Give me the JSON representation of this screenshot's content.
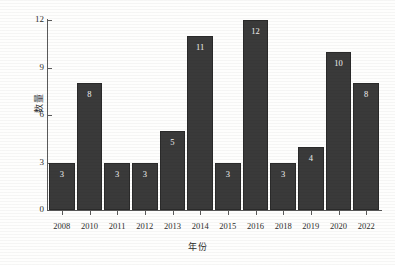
{
  "chart_data": {
    "type": "bar",
    "title": "",
    "subtitle": "",
    "xlabel": "年份",
    "ylabel": "数量",
    "categories": [
      "2008",
      "2010",
      "2011",
      "2012",
      "2013",
      "2014",
      "2015",
      "2016",
      "2018",
      "2019",
      "2020",
      "2022"
    ],
    "values": [
      3,
      8,
      3,
      3,
      5,
      11,
      3,
      12,
      3,
      4,
      10,
      8
    ],
    "value_labels": [
      "3",
      "8",
      "3",
      "3",
      "5",
      "11",
      "3",
      "12",
      "3",
      "4",
      "10",
      "8"
    ],
    "ylim": [
      0,
      12
    ],
    "yticks": [
      0,
      3,
      6,
      9,
      12
    ],
    "ytick_labels": [
      "0",
      "3",
      "6",
      "9",
      "12"
    ],
    "grid": false,
    "legend": null,
    "legend_position": "none",
    "bar_color": "#3a3a3a",
    "value_label_color": "#f2f2f2",
    "axis_color": "#5a5a5a",
    "background_color": "#fefefd"
  },
  "axes": {
    "y_label_text": "数量",
    "x_label_text": "年份"
  }
}
